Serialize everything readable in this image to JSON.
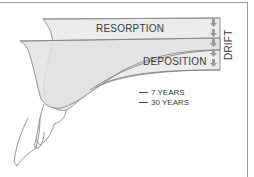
{
  "diagram": {
    "labels": {
      "resorption": "RESORPTION",
      "deposition": "DEPOSITION",
      "drift": "DRIFT"
    },
    "legend": [
      {
        "label": "7 YEARS",
        "line_color": "#444444"
      },
      {
        "label": "30 YEARS",
        "line_color": "#444444"
      }
    ],
    "arrows": {
      "count": 5,
      "direction": "down",
      "color": "#9a9a9a"
    },
    "colors": {
      "fill_light": "#ececec",
      "fill_mid": "#e0e0e0",
      "outline": "#7a7a7a",
      "text": "#3a3a3a",
      "frame": "#9a9a9a"
    }
  }
}
